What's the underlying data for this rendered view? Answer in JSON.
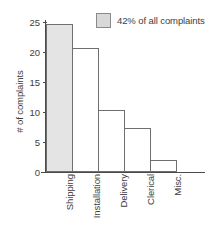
{
  "chart_data": {
    "type": "bar",
    "title": "",
    "xlabel": "",
    "ylabel": "# of complaints",
    "categories": [
      "Shipping",
      "Installation",
      "Delivery",
      "Clerical",
      "Misc."
    ],
    "values": [
      24.7,
      20.6,
      10.3,
      7.3,
      2.0
    ],
    "highlight_index": 0,
    "ylim": [
      0,
      25
    ],
    "yticks": [
      0,
      5,
      10,
      15,
      20,
      25
    ],
    "ytick_labels": [
      "0",
      "5",
      "10",
      "15",
      "20",
      "25"
    ],
    "grid": false,
    "legend": {
      "position": "top-right",
      "entries": [
        {
          "label": "42% of all complaints",
          "swatch_color": "#d8d8d8",
          "swatch_border": "#8a8a8a"
        }
      ]
    },
    "bar_style": {
      "fill_default": "#ffffff",
      "fill_highlight": "#e4e4e4",
      "edge_color": "#6f6f6f",
      "gap": 0
    },
    "axis_color": "#4a4a4a",
    "text_color": "#3d3d3d"
  }
}
